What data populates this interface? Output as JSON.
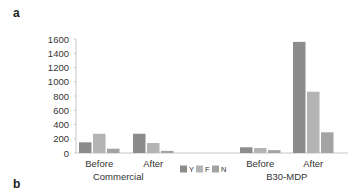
{
  "panel_labels": {
    "top": "a",
    "bottom": "b"
  },
  "colors": {
    "Y": "#8c8c8c",
    "F": "#b4b4b4",
    "N": "#a3a3a3",
    "axis": "#c8c8c8",
    "text": "#333333"
  },
  "chart_data": {
    "type": "bar",
    "title": "",
    "xlabel": "",
    "ylabel": "",
    "ylim": [
      0,
      1600
    ],
    "yticks": [
      0,
      200,
      400,
      600,
      800,
      1000,
      1200,
      1400,
      1600
    ],
    "grid": false,
    "legend": {
      "entries": [
        "Y",
        "F",
        "N"
      ],
      "position": "bottom-center"
    },
    "groups": [
      {
        "name": "Commercial",
        "subcategories": [
          "Before",
          "After"
        ]
      },
      {
        "name": "B30-MDP",
        "subcategories": [
          "Before",
          "After"
        ]
      }
    ],
    "categories": [
      "Commercial Before",
      "Commercial After",
      "B30-MDP Before",
      "B30-MDP After"
    ],
    "series": [
      {
        "name": "Y",
        "values": [
          150,
          270,
          80,
          1560
        ]
      },
      {
        "name": "F",
        "values": [
          270,
          140,
          70,
          860
        ]
      },
      {
        "name": "N",
        "values": [
          60,
          30,
          40,
          290
        ]
      }
    ]
  }
}
